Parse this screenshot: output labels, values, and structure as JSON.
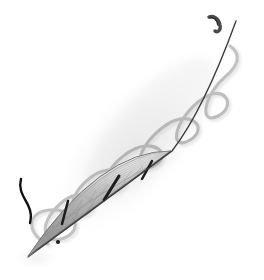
{
  "canvas": {
    "width": 264,
    "height": 280,
    "background_color": "#ffffff",
    "title": "Balloon catheter device with guidewire"
  },
  "palette": {
    "background": "#ffffff",
    "shadow_haze": "#e8e8e8",
    "guidewire_dark": "#3a3a3a",
    "helix_gray": "#b9b9b9",
    "helix_gray_soft": "#c9c9c9",
    "balloon_body_light": "#c2c2c2",
    "balloon_body_mid": "#a6a6a6",
    "balloon_body_dark": "#8e8e8e",
    "balloon_outline": "#6f6f6f",
    "mesh_line": "#8a8a8a",
    "strut_black": "#1c1c1c",
    "tail_black": "#121212",
    "tip_dark": "#4a4a4a"
  },
  "scene": {
    "axis": {
      "label": "device-long-axis",
      "start_x": 28,
      "start_y": 256,
      "end_x": 234,
      "end_y": 24,
      "angle_degrees": -48
    },
    "haze": {
      "label": "soft-diagonal-shadow",
      "center_x": 132,
      "center_y": 150,
      "radius_x": 120,
      "radius_y": 58,
      "rotation_degrees": -48,
      "opacity": 0.5
    }
  },
  "parts": {
    "balloon": {
      "name": "Balloon / stent body",
      "shape": "lens",
      "tip_proximal_x": 28,
      "tip_proximal_y": 256,
      "tip_distal_x": 171,
      "tip_distal_y": 151,
      "max_half_width": 27,
      "mesh_strand_count": 14,
      "striation_count": 18
    },
    "struts": {
      "name": "Radiopaque markers",
      "count": 3,
      "items": [
        {
          "id": "strut-proximal",
          "x1": 62,
          "y1": 223,
          "x2": 68,
          "y2": 201,
          "width": 2.6
        },
        {
          "id": "strut-middle",
          "x1": 105,
          "y1": 199,
          "x2": 118,
          "y2": 177,
          "width": 3.0
        },
        {
          "id": "strut-distal",
          "x1": 143,
          "y1": 178,
          "x2": 152,
          "y2": 162,
          "width": 2.6
        }
      ]
    },
    "dot_marker": {
      "name": "Small proximal dot marker",
      "x": 58,
      "y": 242,
      "radius": 2.0
    },
    "guidewire": {
      "name": "Guidewire core",
      "color": "#3a3a3a",
      "stroke_width": 1.3,
      "from_x": 28,
      "from_y": 256,
      "to_x": 237,
      "to_y": 20
    },
    "helix": {
      "name": "Coiled wire sheath",
      "turn_count": 5,
      "loop_width": 30,
      "stroke_width": 3.0,
      "color": "#b9b9b9",
      "start_x": 48,
      "start_y": 243,
      "end_x": 225,
      "end_y": 42
    },
    "distal_tip": {
      "name": "Curved distal tip hook",
      "x": 212,
      "y": 16,
      "length": 14,
      "color": "#4a4a4a"
    },
    "proximal_tail": {
      "name": "Free black S-curve filament",
      "start_x": 21,
      "start_y": 178,
      "end_x": 31,
      "end_y": 222,
      "stroke_width": 2.4,
      "color": "#121212"
    }
  },
  "labels": {
    "figure_caption": "",
    "annotations": []
  }
}
